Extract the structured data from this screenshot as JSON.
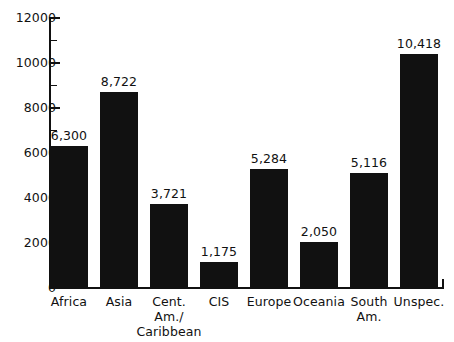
{
  "chart_data": {
    "type": "bar",
    "title": "",
    "subtitle": "",
    "xlabel": "",
    "ylabel": "",
    "categories": [
      "Africa",
      "Asia",
      "Cent.\nAm./\nCaribbean",
      "CIS",
      "Europe",
      "Oceania",
      "South\nAm.",
      "Unspec."
    ],
    "values": [
      6300,
      8722,
      3721,
      1175,
      5284,
      2050,
      5116,
      10418
    ],
    "value_labels": [
      "6,300",
      "8,722",
      "3,721",
      "1,175",
      "5,284",
      "2,050",
      "5,116",
      "10,418"
    ],
    "ylim": [
      0,
      12000
    ],
    "ytick_values": [
      0,
      2000,
      4000,
      6000,
      8000,
      10000,
      12000
    ],
    "ytick_labels": [
      "0",
      "2000",
      "4000",
      "6000",
      "8000",
      "10000",
      "12000"
    ],
    "yminor_tick_values": [
      1000,
      3000,
      5000,
      7000,
      9000,
      11000
    ],
    "grid": false,
    "legend": null,
    "legend_position": "none",
    "bar_color": "#111111",
    "background_color": "#ffffff",
    "axis_color": "#111111"
  }
}
